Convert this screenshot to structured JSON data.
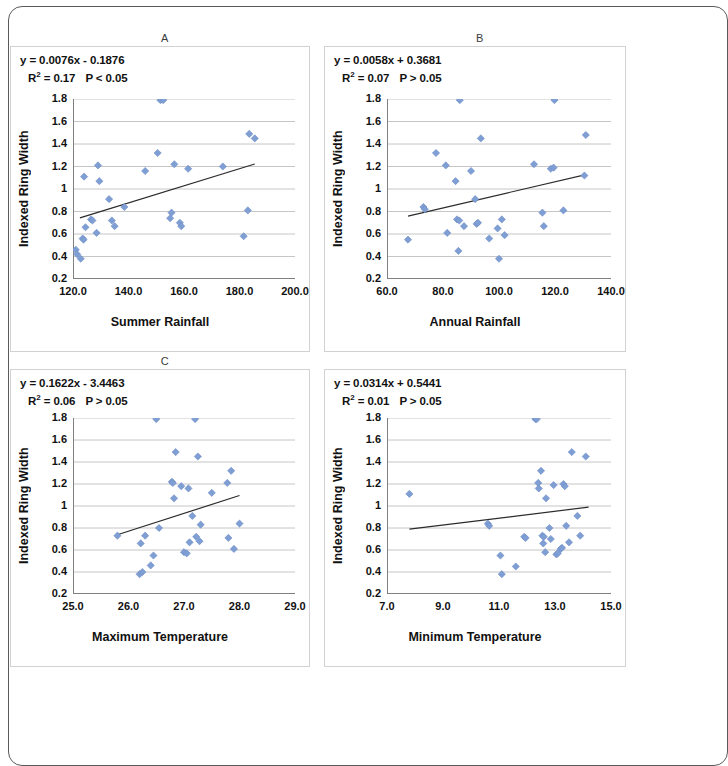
{
  "figure": {
    "marker_color": "#7f9fd4",
    "marker_edge": "#6b8cc4",
    "trendline_color": "#2b2b2b",
    "grid_color": "#b8b8b8",
    "axis_color": "#808080",
    "panel_border": "#d2d2d2",
    "frame_color": "#5a5a5a"
  },
  "chart_data": [
    {
      "type": "scatter",
      "panel": "A",
      "title": "A",
      "annotation_line1": "y = 0.0076x - 0.1876",
      "annotation_line2_r2": "R² = 0.17",
      "annotation_line2_p": "P < 0.05",
      "equation": "y = 0.0076x - 0.1876",
      "slope": 0.0076,
      "intercept": -0.1876,
      "r2": 0.17,
      "p_text": "P < 0.05",
      "xlabel": "Summer Rainfall",
      "ylabel": "Indexed Ring Width",
      "xlim": [
        120.0,
        200.0
      ],
      "ylim": [
        0.2,
        1.8
      ],
      "xticks": [
        "120.0",
        "140.0",
        "160.0",
        "180.0",
        "200.0"
      ],
      "xtick_values": [
        120.0,
        140.0,
        160.0,
        180.0,
        200.0
      ],
      "yticks": [
        "0.2",
        "0.4",
        "0.6",
        "0.8",
        "1",
        "1.2",
        "1.4",
        "1.6",
        "1.8"
      ],
      "ytick_values": [
        0.2,
        0.4,
        0.6,
        0.8,
        1.0,
        1.2,
        1.4,
        1.6,
        1.8
      ],
      "grid": true,
      "legend": "none",
      "trendline_x": [
        122.5,
        185.5
      ],
      "points": [
        [
          121.0,
          0.46
        ],
        [
          121.5,
          0.42
        ],
        [
          122.8,
          0.38
        ],
        [
          123.5,
          0.56
        ],
        [
          123.8,
          0.55
        ],
        [
          124.5,
          0.66
        ],
        [
          124.0,
          1.11
        ],
        [
          126.5,
          0.73
        ],
        [
          127.0,
          0.72
        ],
        [
          128.5,
          0.61
        ],
        [
          129.0,
          1.21
        ],
        [
          129.5,
          1.07
        ],
        [
          133.0,
          0.91
        ],
        [
          134.0,
          0.72
        ],
        [
          135.0,
          0.67
        ],
        [
          138.5,
          0.84
        ],
        [
          146.0,
          1.16
        ],
        [
          150.5,
          1.32
        ],
        [
          151.5,
          1.79
        ],
        [
          152.5,
          1.79
        ],
        [
          155.0,
          0.74
        ],
        [
          155.5,
          0.79
        ],
        [
          156.5,
          1.22
        ],
        [
          158.5,
          0.7
        ],
        [
          159.0,
          0.67
        ],
        [
          161.5,
          1.18
        ],
        [
          174.0,
          1.2
        ],
        [
          181.5,
          0.58
        ],
        [
          183.0,
          0.81
        ],
        [
          183.5,
          1.49
        ],
        [
          185.5,
          1.45
        ]
      ]
    },
    {
      "type": "scatter",
      "panel": "B",
      "title": "B",
      "annotation_line1": "y = 0.0058x + 0.3681",
      "annotation_line2_r2": "R² = 0.07",
      "annotation_line2_p": "P > 0.05",
      "equation": "y = 0.0058x + 0.3681",
      "slope": 0.0058,
      "intercept": 0.3681,
      "r2": 0.07,
      "p_text": "P > 0.05",
      "xlabel": "Annual Rainfall",
      "ylabel": "Indexed Ring Width",
      "xlim": [
        60.0,
        140.0
      ],
      "ylim": [
        0.2,
        1.8
      ],
      "xticks": [
        "60.0",
        "80.0",
        "100.0",
        "120.0",
        "140.0"
      ],
      "xtick_values": [
        60.0,
        80.0,
        100.0,
        120.0,
        140.0
      ],
      "yticks": [
        "0.2",
        "0.4",
        "0.6",
        "0.8",
        "1",
        "1.2",
        "1.4",
        "1.6",
        "1.8"
      ],
      "ytick_values": [
        0.2,
        0.4,
        0.6,
        0.8,
        1.0,
        1.2,
        1.4,
        1.6,
        1.8
      ],
      "grid": true,
      "legend": "none",
      "trendline_x": [
        67.5,
        131.0
      ],
      "points": [
        [
          67.5,
          0.55
        ],
        [
          73.0,
          0.84
        ],
        [
          73.5,
          0.82
        ],
        [
          77.5,
          1.32
        ],
        [
          81.0,
          1.21
        ],
        [
          81.5,
          0.61
        ],
        [
          84.5,
          1.07
        ],
        [
          85.5,
          0.45
        ],
        [
          85.0,
          0.73
        ],
        [
          85.8,
          0.72
        ],
        [
          86.0,
          1.79
        ],
        [
          87.5,
          0.67
        ],
        [
          90.0,
          1.16
        ],
        [
          91.5,
          0.91
        ],
        [
          92.0,
          0.69
        ],
        [
          92.5,
          0.7
        ],
        [
          93.5,
          1.45
        ],
        [
          96.5,
          0.56
        ],
        [
          99.5,
          0.65
        ],
        [
          100.0,
          0.38
        ],
        [
          101.0,
          0.73
        ],
        [
          102.0,
          0.59
        ],
        [
          112.5,
          1.22
        ],
        [
          115.5,
          0.79
        ],
        [
          116.0,
          0.67
        ],
        [
          118.5,
          1.18
        ],
        [
          119.5,
          1.19
        ],
        [
          119.8,
          1.79
        ],
        [
          123.0,
          0.81
        ],
        [
          130.5,
          1.12
        ],
        [
          131.0,
          1.48
        ]
      ]
    },
    {
      "type": "scatter",
      "panel": "C",
      "title": "C",
      "annotation_line1": "y = 0.1622x - 3.4463",
      "annotation_line2_r2": "R² = 0.06",
      "annotation_line2_p": "P > 0.05",
      "equation": "y = 0.1622x - 3.4463",
      "slope": 0.1622,
      "intercept": -3.4463,
      "r2": 0.06,
      "p_text": "P > 0.05",
      "xlabel": "Maximum Temperature",
      "ylabel": "Indexed Ring Width",
      "xlim": [
        25.0,
        29.0
      ],
      "ylim": [
        0.2,
        1.8
      ],
      "xticks": [
        "25.0",
        "26.0",
        "27.0",
        "28.0",
        "29.0"
      ],
      "xtick_values": [
        25.0,
        26.0,
        27.0,
        28.0,
        29.0
      ],
      "yticks": [
        "0.2",
        "0.4",
        "0.6",
        "0.8",
        "1",
        "1.2",
        "1.4",
        "1.6",
        "1.8"
      ],
      "ytick_values": [
        0.2,
        0.4,
        0.6,
        0.8,
        1.0,
        1.2,
        1.4,
        1.6,
        1.8
      ],
      "grid": true,
      "legend": "none",
      "trendline_x": [
        25.8,
        28.0
      ],
      "points": [
        [
          25.8,
          0.73
        ],
        [
          26.2,
          0.38
        ],
        [
          26.25,
          0.4
        ],
        [
          26.22,
          0.66
        ],
        [
          26.3,
          0.73
        ],
        [
          26.4,
          0.46
        ],
        [
          26.45,
          0.55
        ],
        [
          26.5,
          1.79
        ],
        [
          26.55,
          0.8
        ],
        [
          26.78,
          1.22
        ],
        [
          26.8,
          1.21
        ],
        [
          26.82,
          1.07
        ],
        [
          26.85,
          1.49
        ],
        [
          26.95,
          1.18
        ],
        [
          27.0,
          0.58
        ],
        [
          27.05,
          0.57
        ],
        [
          27.08,
          1.16
        ],
        [
          27.1,
          0.67
        ],
        [
          27.15,
          0.91
        ],
        [
          27.2,
          1.79
        ],
        [
          27.22,
          0.72
        ],
        [
          27.25,
          1.45
        ],
        [
          27.28,
          0.68
        ],
        [
          27.3,
          0.83
        ],
        [
          27.5,
          1.12
        ],
        [
          27.78,
          1.21
        ],
        [
          27.8,
          0.71
        ],
        [
          27.85,
          1.32
        ],
        [
          27.9,
          0.61
        ],
        [
          28.0,
          0.84
        ]
      ]
    },
    {
      "type": "scatter",
      "panel": "D",
      "title": "",
      "annotation_line1": "y = 0.0314x + 0.5441",
      "annotation_line2_r2": "R² = 0.01",
      "annotation_line2_p": "P > 0.05",
      "equation": "y = 0.0314x + 0.5441",
      "slope": 0.0314,
      "intercept": 0.5441,
      "r2": 0.01,
      "p_text": "P > 0.05",
      "xlabel": "Minimum Temperature",
      "ylabel": "Indexed Ring Width",
      "xlim": [
        7.0,
        15.0
      ],
      "ylim": [
        0.2,
        1.8
      ],
      "xticks": [
        "7.0",
        "9.0",
        "11.0",
        "13.0",
        "15.0"
      ],
      "xtick_values": [
        7.0,
        9.0,
        11.0,
        13.0,
        15.0
      ],
      "yticks": [
        "0.2",
        "0.4",
        "0.6",
        "0.8",
        "1",
        "1.2",
        "1.4",
        "1.6",
        "1.8"
      ],
      "ytick_values": [
        0.2,
        0.4,
        0.6,
        0.8,
        1.0,
        1.2,
        1.4,
        1.6,
        1.8
      ],
      "grid": true,
      "legend": "none",
      "trendline_x": [
        7.8,
        14.2
      ],
      "points": [
        [
          7.8,
          1.11
        ],
        [
          10.6,
          0.84
        ],
        [
          10.65,
          0.82
        ],
        [
          11.05,
          0.55
        ],
        [
          11.1,
          0.38
        ],
        [
          11.6,
          0.45
        ],
        [
          11.9,
          0.72
        ],
        [
          11.95,
          0.71
        ],
        [
          12.3,
          1.79
        ],
        [
          12.35,
          1.79
        ],
        [
          12.4,
          1.21
        ],
        [
          12.42,
          1.16
        ],
        [
          12.5,
          1.32
        ],
        [
          12.55,
          0.73
        ],
        [
          12.58,
          0.66
        ],
        [
          12.6,
          0.72
        ],
        [
          12.65,
          0.58
        ],
        [
          12.68,
          1.07
        ],
        [
          12.8,
          0.8
        ],
        [
          12.85,
          0.7
        ],
        [
          12.95,
          1.19
        ],
        [
          13.05,
          0.56
        ],
        [
          13.1,
          0.57
        ],
        [
          13.2,
          0.61
        ],
        [
          13.25,
          0.62
        ],
        [
          13.3,
          1.2
        ],
        [
          13.35,
          1.18
        ],
        [
          13.4,
          0.82
        ],
        [
          13.5,
          0.67
        ],
        [
          13.6,
          1.49
        ],
        [
          13.8,
          0.91
        ],
        [
          13.9,
          0.73
        ],
        [
          14.1,
          1.45
        ]
      ]
    }
  ]
}
